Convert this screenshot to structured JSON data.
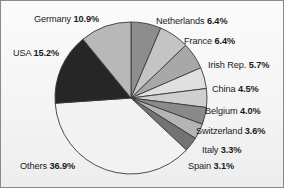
{
  "chart_data": {
    "type": "pie",
    "title": "",
    "subtitle": "",
    "xlabel": "",
    "ylabel": "",
    "legend_position": "none",
    "grid": false,
    "value_unit": "%",
    "categories": [
      "Netherlands",
      "France",
      "Irish Rep.",
      "China",
      "Belgium",
      "Switzerland",
      "Italy",
      "Spain",
      "Others",
      "USA",
      "Germany"
    ],
    "values": [
      6.4,
      6.4,
      5.7,
      4.5,
      4.0,
      3.6,
      3.3,
      3.1,
      36.9,
      15.2,
      10.9
    ],
    "slices": [
      {
        "label": "Netherlands",
        "value": 6.4,
        "value_text": "6.4%",
        "color": "#8d8d8d"
      },
      {
        "label": "France",
        "value": 6.4,
        "value_text": "6.4%",
        "color": "#c4c4c4"
      },
      {
        "label": "Irish Rep.",
        "value": 5.7,
        "value_text": "5.7%",
        "color": "#a8a8a8"
      },
      {
        "label": "China",
        "value": 4.5,
        "value_text": "4.5%",
        "color": "#e0e0e0"
      },
      {
        "label": "Belgium",
        "value": 4.0,
        "value_text": "4.0%",
        "color": "#cfcfcf"
      },
      {
        "label": "Switzerland",
        "value": 3.6,
        "value_text": "3.6%",
        "color": "#8a8a8a"
      },
      {
        "label": "Italy",
        "value": 3.3,
        "value_text": "3.3%",
        "color": "#b4b4b4"
      },
      {
        "label": "Spain",
        "value": 3.1,
        "value_text": "3.1%",
        "color": "#737373"
      },
      {
        "label": "Others",
        "value": 36.9,
        "value_text": "36.9%",
        "color": "#f2f2f2"
      },
      {
        "label": "USA",
        "value": 15.2,
        "value_text": "15.2%",
        "color": "#262626"
      },
      {
        "label": "Germany",
        "value": 10.9,
        "value_text": "10.9%",
        "color": "#b8b8b8"
      }
    ],
    "start_angle_deg": 0,
    "direction": "clockwise",
    "stroke_color": "#3a3a3a",
    "background_color": "#f4f4f4"
  },
  "labels": {
    "germany": {
      "name": "Germany",
      "pct": "10.9%"
    },
    "netherlands": {
      "name": "Netherlands",
      "pct": "6.4%"
    },
    "france": {
      "name": "France",
      "pct": "6.4%"
    },
    "irish_rep": {
      "name": "Irish Rep.",
      "pct": "5.7%"
    },
    "china": {
      "name": "China",
      "pct": "4.5%"
    },
    "belgium": {
      "name": "Belgium",
      "pct": "4.0%"
    },
    "switzerland": {
      "name": "Switzerland",
      "pct": "3.6%"
    },
    "italy": {
      "name": "Italy",
      "pct": "3.3%"
    },
    "spain": {
      "name": "Spain",
      "pct": "3.1%"
    },
    "usa": {
      "name": "USA",
      "pct": "15.2%"
    },
    "others": {
      "name": "Others",
      "pct": "36.9%"
    }
  }
}
